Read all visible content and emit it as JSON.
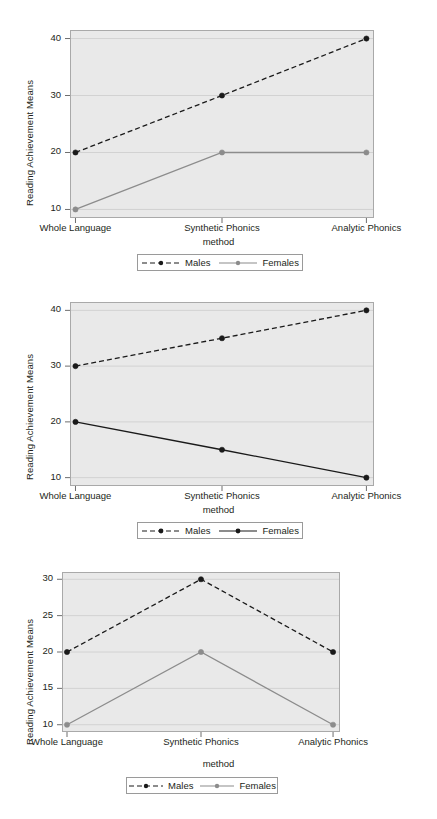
{
  "figure": {
    "panel_count": 3,
    "axis_title_y": "Reading Achievement Means",
    "axis_title_x": "method",
    "categories": [
      "Whole Language",
      "Synthetic Phonics",
      "Analytic Phonics"
    ],
    "legend": {
      "males_label": "Males",
      "females_label": "Females",
      "males_icon": "dashed-line-with-dot-marker",
      "females_icon": "solid-line-with-dot-marker"
    },
    "colors": {
      "plot_background": "#e9e9e9",
      "plot_border": "#a9a9a9",
      "gridline": "#d2d2d2",
      "males_series": "#1a1a1a",
      "females_series_gray": "#8c8c8c",
      "females_series_black": "#1a1a1a",
      "text": "#231f20",
      "page_background": "#ffffff"
    }
  },
  "chart_data": [
    {
      "type": "line",
      "title": "",
      "panel": 1,
      "xlabel": "method",
      "ylabel": "Reading Achievement Means",
      "categories": [
        "Whole Language",
        "Synthetic Phonics",
        "Analytic Phonics"
      ],
      "yticks": [
        10,
        20,
        30,
        40
      ],
      "ylim": [
        8.5,
        41.5
      ],
      "grid": true,
      "legend_position": "bottom",
      "series": [
        {
          "name": "Males",
          "values": [
            20,
            30,
            40
          ],
          "style": "dashed",
          "color": "#1a1a1a",
          "marker": "circle"
        },
        {
          "name": "Females",
          "values": [
            10,
            20,
            20
          ],
          "style": "solid",
          "color": "#8c8c8c",
          "marker": "circle"
        }
      ]
    },
    {
      "type": "line",
      "title": "",
      "panel": 2,
      "xlabel": "method",
      "ylabel": "Reading Achievement Means",
      "categories": [
        "Whole Language",
        "Synthetic Phonics",
        "Analytic Phonics"
      ],
      "yticks": [
        10,
        20,
        30,
        40
      ],
      "ylim": [
        8.5,
        41.5
      ],
      "grid": true,
      "legend_position": "bottom",
      "series": [
        {
          "name": "Males",
          "values": [
            30,
            35,
            40
          ],
          "style": "dashed",
          "color": "#1a1a1a",
          "marker": "circle"
        },
        {
          "name": "Females",
          "values": [
            20,
            15,
            10
          ],
          "style": "solid",
          "color": "#1a1a1a",
          "marker": "circle"
        }
      ]
    },
    {
      "type": "line",
      "title": "",
      "panel": 3,
      "xlabel": "method",
      "ylabel": "Reading Achievement Means",
      "categories": [
        "Whole Language",
        "Synthetic Phonics",
        "Analytic Phonics"
      ],
      "yticks": [
        10,
        15,
        20,
        25,
        30
      ],
      "ylim": [
        9,
        31
      ],
      "grid": true,
      "legend_position": "bottom",
      "series": [
        {
          "name": "Males",
          "values": [
            20,
            30,
            20
          ],
          "style": "dashed",
          "color": "#1a1a1a",
          "marker": "circle"
        },
        {
          "name": "Females",
          "values": [
            10,
            20,
            10
          ],
          "style": "solid",
          "color": "#8c8c8c",
          "marker": "circle"
        }
      ]
    }
  ]
}
